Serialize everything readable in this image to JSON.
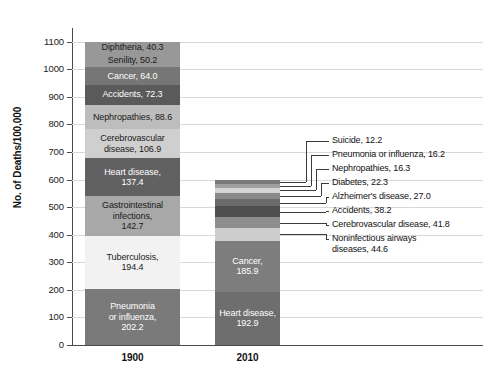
{
  "chart_data": {
    "type": "bar",
    "title": "",
    "subtitle": "",
    "xlabel": "",
    "ylabel": "No. of Deaths/100,000",
    "ylim": [
      0,
      1150
    ],
    "yticks": [
      0,
      100,
      200,
      300,
      400,
      500,
      600,
      700,
      800,
      900,
      1000,
      1100
    ],
    "ytick_labels": [
      "0",
      "100",
      "200",
      "300",
      "400",
      "500",
      "600",
      "700",
      "800",
      "900",
      "1000",
      "1100"
    ],
    "grid": true,
    "legend": "none",
    "stacked": true,
    "categories": [
      "1900",
      "2010"
    ],
    "series": [
      {
        "category": "1900",
        "total": 1149.0,
        "label_placement": "inside",
        "segments": [
          {
            "name": "Pneumonia or influenza",
            "label": "Pneumonia\nor influenza,\n202.2",
            "value": 202.2,
            "color": "#7a7a7a",
            "text_color": "#ffffff"
          },
          {
            "name": "Tuberculosis",
            "label": "Tuberculosis,\n194.4",
            "value": 194.4,
            "color": "#f2f2f2",
            "text_color": "#1a1a1a"
          },
          {
            "name": "Gastrointestinal infections",
            "label": "Gastrointestinal\ninfections,\n142.7",
            "value": 142.7,
            "color": "#a8a8a8",
            "text_color": "#1a1a1a"
          },
          {
            "name": "Heart disease",
            "label": "Heart disease,\n137.4",
            "value": 137.4,
            "color": "#616161",
            "text_color": "#ffffff"
          },
          {
            "name": "Cerebrovascular disease",
            "label": "Cerebrovascular\ndisease, 106.9",
            "value": 106.9,
            "color": "#cfcfcf",
            "text_color": "#1a1a1a"
          },
          {
            "name": "Nephropathies",
            "label": "Nephropathies, 88.6",
            "value": 88.6,
            "color": "#bdbdbd",
            "text_color": "#1a1a1a"
          },
          {
            "name": "Accidents",
            "label": "Accidents, 72.3",
            "value": 72.3,
            "color": "#5a5a5a",
            "text_color": "#ffffff"
          },
          {
            "name": "Cancer",
            "label": "Cancer, 64.0",
            "value": 64.0,
            "color": "#767676",
            "text_color": "#ffffff"
          },
          {
            "name": "Senility",
            "label": "Senility, 50.2",
            "value": 50.2,
            "color": "#989898",
            "text_color": "#1a1a1a"
          },
          {
            "name": "Diphtheria",
            "label": "Diphtheria, 40.3",
            "value": 40.3,
            "color": "#989898",
            "text_color": "#1a1a1a"
          }
        ]
      },
      {
        "category": "2010",
        "total": 597.4,
        "label_placement": "mixed",
        "segments": [
          {
            "name": "Heart disease",
            "label": "Heart disease,\n192.9",
            "value": 192.9,
            "color": "#6e6e6e",
            "text_color": "#ffffff"
          },
          {
            "name": "Cancer",
            "label": "Cancer,\n185.9",
            "value": 185.9,
            "color": "#7d7d7d",
            "text_color": "#ffffff"
          },
          {
            "name": "Noninfectious airways diseases",
            "label": "",
            "value": 44.6,
            "color": "#cdcdcd",
            "text_color": "#1a1a1a"
          },
          {
            "name": "Cerebrovascular disease",
            "label": "",
            "value": 41.8,
            "color": "#8d8d8d",
            "text_color": "#ffffff"
          },
          {
            "name": "Accidents",
            "label": "",
            "value": 38.2,
            "color": "#4f4f4f",
            "text_color": "#ffffff"
          },
          {
            "name": "Alzheimer's disease",
            "label": "",
            "value": 27.0,
            "color": "#6b6b6b",
            "text_color": "#ffffff"
          },
          {
            "name": "Diabetes",
            "label": "",
            "value": 22.3,
            "color": "#8a8a8a",
            "text_color": "#ffffff"
          },
          {
            "name": "Nephropathies",
            "label": "",
            "value": 16.3,
            "color": "#d6d6d6",
            "text_color": "#1a1a1a"
          },
          {
            "name": "Pneumonia or influenza",
            "label": "",
            "value": 16.2,
            "color": "#a0a0a0",
            "text_color": "#1a1a1a"
          },
          {
            "name": "Suicide",
            "label": "",
            "value": 12.2,
            "color": "#7a7a7a",
            "text_color": "#ffffff"
          }
        ]
      }
    ],
    "callouts": [
      {
        "label": "Suicide, 12.2",
        "value": 12.2
      },
      {
        "label": "Pneumonia or influenza, 16.2",
        "value": 16.2
      },
      {
        "label": "Nephropathies, 16.3",
        "value": 16.3
      },
      {
        "label": "Diabetes, 22.3",
        "value": 22.3
      },
      {
        "label": "Alzheimer's disease, 27.0",
        "value": 27.0
      },
      {
        "label": "Accidents, 38.2",
        "value": 38.2
      },
      {
        "label": "Cerebrovascular disease, 41.8",
        "value": 41.8
      },
      {
        "label": "Noninfectious airways\ndiseases, 44.6",
        "value": 44.6
      }
    ]
  },
  "axis": {
    "y_title": "No. of Deaths/100,000",
    "y_ticks": [
      "1100",
      "1000",
      "900",
      "800",
      "700",
      "600",
      "500",
      "400",
      "300",
      "200",
      "100",
      "0"
    ],
    "x_ticks": [
      "1900",
      "2010"
    ]
  },
  "bar_1900_labels": [
    "Diphtheria, 40.3",
    "Senility, 50.2",
    "Cancer, 64.0",
    "Accidents, 72.3",
    "Nephropathies, 88.6",
    "Cerebrovascular\ndisease, 106.9",
    "Heart disease,\n137.4",
    "Gastrointestinal\ninfections,\n142.7",
    "Tuberculosis,\n194.4",
    "Pneumonia\nor influenza,\n202.2"
  ],
  "bar_2010_labels": [
    "Cancer,\n185.9",
    "Heart disease,\n192.9"
  ],
  "callout_labels": [
    "Suicide, 12.2",
    "Pneumonia or influenza, 16.2",
    "Nephropathies, 16.3",
    "Diabetes, 22.3",
    "Alzheimer's disease, 27.0",
    "Accidents, 38.2",
    "Cerebrovascular disease, 41.8",
    "Noninfectious airways\ndiseases, 44.6"
  ],
  "colors": {
    "grid": "#d9d9d9",
    "axis": "#4a4a4a",
    "text": "#111111",
    "leader": "#3a3a3a",
    "background": "#ffffff"
  }
}
